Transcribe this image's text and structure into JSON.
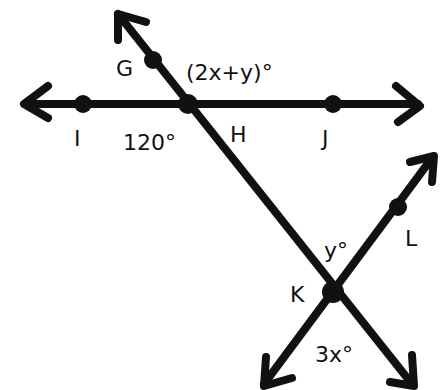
{
  "diagram": {
    "type": "geometry-lines-angles",
    "stroke_color": "#111111",
    "background": "#ffffff",
    "points": [
      {
        "name": "G",
        "label": "G",
        "x": 153,
        "y": 60
      },
      {
        "name": "I",
        "label": "I",
        "x": 83,
        "y": 104
      },
      {
        "name": "H",
        "label": "H",
        "x": 188,
        "y": 104
      },
      {
        "name": "J",
        "label": "J",
        "x": 333,
        "y": 104
      },
      {
        "name": "L",
        "label": "L",
        "x": 398,
        "y": 207
      },
      {
        "name": "K",
        "label": "K",
        "x": 333,
        "y": 292
      }
    ],
    "lines": [
      {
        "name": "line-IJ",
        "through": [
          "I",
          "H",
          "J"
        ],
        "arrows": "both"
      },
      {
        "name": "line-GK",
        "through": [
          "G",
          "H",
          "K"
        ],
        "arrows": "both"
      },
      {
        "name": "line-KL",
        "through": [
          "K",
          "L"
        ],
        "arrows": "both"
      }
    ],
    "angle_labels": [
      {
        "name": "angle-2x-plus-y",
        "text": "(2x+y)°"
      },
      {
        "name": "angle-120",
        "text": "120°"
      },
      {
        "name": "angle-y",
        "text": "y°"
      },
      {
        "name": "angle-3x",
        "text": "3x°"
      }
    ]
  }
}
